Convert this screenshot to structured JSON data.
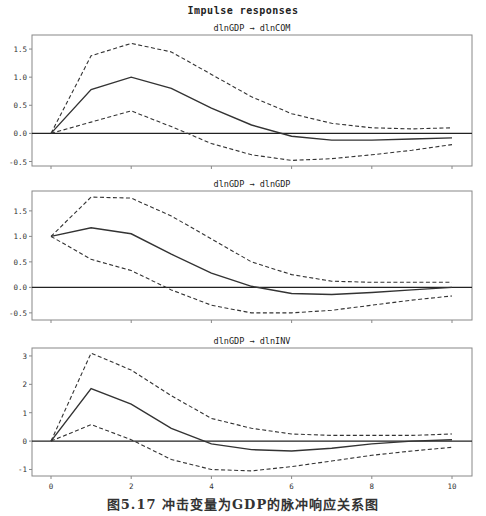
{
  "title": "Impulse responses",
  "caption": "图5.17   冲击变量为GDP的脉冲响应关系图",
  "colors": {
    "line": "#333333",
    "frame": "#888888",
    "zero": "#222222"
  },
  "chart_data": [
    {
      "type": "line",
      "title": "dlnGDP → dlnCOM",
      "x": [
        0,
        1,
        2,
        3,
        4,
        5,
        6,
        7,
        8,
        9,
        10
      ],
      "xticks": [
        0,
        2,
        4,
        6,
        8,
        10
      ],
      "yticks": [
        -0.5,
        0.0,
        0.5,
        1.0,
        1.5
      ],
      "ytick_labels": [
        "-0.5",
        "0.0",
        "0.5",
        "1.0",
        "1.5"
      ],
      "ylim": [
        -0.58,
        1.75
      ],
      "series": [
        {
          "name": "response",
          "style": "solid",
          "values": [
            0,
            0.78,
            1.0,
            0.8,
            0.45,
            0.15,
            -0.05,
            -0.12,
            -0.12,
            -0.1,
            -0.08
          ]
        },
        {
          "name": "upper",
          "style": "dashed",
          "values": [
            0,
            1.38,
            1.6,
            1.45,
            1.05,
            0.65,
            0.35,
            0.18,
            0.1,
            0.08,
            0.1
          ]
        },
        {
          "name": "lower",
          "style": "dashed",
          "values": [
            0,
            0.2,
            0.4,
            0.12,
            -0.18,
            -0.38,
            -0.48,
            -0.45,
            -0.38,
            -0.3,
            -0.2
          ]
        }
      ]
    },
    {
      "type": "line",
      "title": "dlnGDP → dlnGDP",
      "x": [
        0,
        1,
        2,
        3,
        4,
        5,
        6,
        7,
        8,
        9,
        10
      ],
      "xticks": [
        0,
        2,
        4,
        6,
        8,
        10
      ],
      "yticks": [
        -0.5,
        0.0,
        0.5,
        1.0,
        1.5
      ],
      "ytick_labels": [
        "-0.5",
        "0.0",
        "0.5",
        "1.0",
        "1.5"
      ],
      "ylim": [
        -0.64,
        1.89
      ],
      "series": [
        {
          "name": "response",
          "style": "solid",
          "values": [
            1.0,
            1.17,
            1.05,
            0.65,
            0.28,
            0.02,
            -0.12,
            -0.14,
            -0.1,
            -0.05,
            0.0
          ]
        },
        {
          "name": "upper",
          "style": "dashed",
          "values": [
            1.0,
            1.77,
            1.75,
            1.4,
            0.95,
            0.5,
            0.25,
            0.12,
            0.1,
            0.1,
            0.1
          ]
        },
        {
          "name": "lower",
          "style": "dashed",
          "values": [
            1.0,
            0.55,
            0.33,
            -0.05,
            -0.35,
            -0.5,
            -0.5,
            -0.45,
            -0.35,
            -0.25,
            -0.17
          ]
        }
      ]
    },
    {
      "type": "line",
      "title": "dlnGDP → dlnINV",
      "x": [
        0,
        1,
        2,
        3,
        4,
        5,
        6,
        7,
        8,
        9,
        10
      ],
      "xticks": [
        0,
        2,
        4,
        6,
        8,
        10
      ],
      "xtick_labels": [
        "0",
        "2",
        "4",
        "6",
        "8",
        "10"
      ],
      "yticks": [
        -1,
        0,
        1,
        2,
        3
      ],
      "ytick_labels": [
        "-1",
        "0",
        "1",
        "2",
        "3"
      ],
      "ylim": [
        -1.23,
        3.28
      ],
      "series": [
        {
          "name": "response",
          "style": "solid",
          "values": [
            0,
            1.85,
            1.3,
            0.45,
            -0.1,
            -0.3,
            -0.35,
            -0.25,
            -0.1,
            0.0,
            0.05
          ]
        },
        {
          "name": "upper",
          "style": "dashed",
          "values": [
            0,
            3.1,
            2.5,
            1.6,
            0.8,
            0.45,
            0.25,
            0.2,
            0.2,
            0.2,
            0.25
          ]
        },
        {
          "name": "lower",
          "style": "dashed",
          "values": [
            0,
            0.58,
            0.05,
            -0.65,
            -1.0,
            -1.05,
            -0.9,
            -0.7,
            -0.5,
            -0.35,
            -0.22
          ]
        }
      ]
    }
  ]
}
